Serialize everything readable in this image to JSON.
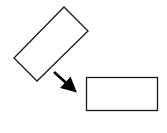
{
  "diagram": {
    "description": "Rotated rectangle transforms into an axis-aligned rectangle",
    "colors": {
      "background": "#ffffff",
      "stroke": "#1a1a1a",
      "arrow": "#000000"
    },
    "shapes": [
      {
        "id": "rotated-rectangle",
        "type": "polygon",
        "points": "64,7 88,31 37,81 14,58",
        "label": "rotated rectangle"
      },
      {
        "id": "aligned-rectangle",
        "type": "rect",
        "x": 86,
        "y": 77,
        "width": 72,
        "height": 34,
        "label": "axis-aligned rectangle"
      }
    ],
    "arrow": {
      "from": [
        54,
        72
      ],
      "to": [
        78,
        94
      ],
      "label": "transforms to"
    }
  }
}
